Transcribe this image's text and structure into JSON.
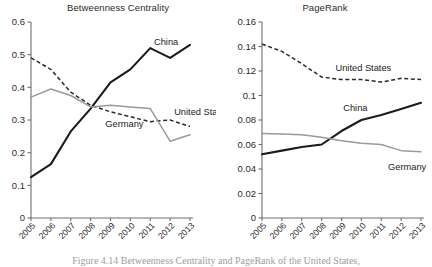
{
  "figure": {
    "caption": "Figure 4.14 Betweenness Centrality and PageRank of the United States,"
  },
  "chart_data": [
    {
      "type": "line",
      "title": "Betweenness Centrality",
      "xlabel": "",
      "ylabel": "",
      "x": [
        "2005",
        "2006",
        "2007",
        "2008",
        "2009",
        "2010",
        "2011",
        "2012",
        "2013"
      ],
      "ylim": [
        0,
        0.6
      ],
      "yticks": [
        "0",
        "0.1",
        "0.2",
        "0.3",
        "0.4",
        "0.5",
        "0.6"
      ],
      "ytick_values": [
        0,
        0.1,
        0.2,
        0.3,
        0.4,
        0.5,
        0.6
      ],
      "grid": false,
      "legend_position": "inline-annotations",
      "series": [
        {
          "name": "China",
          "style": "solid-thick-black",
          "color": "#1b1b1b",
          "label_x": "2012",
          "values": [
            0.125,
            0.165,
            0.265,
            0.335,
            0.415,
            0.455,
            0.52,
            0.49,
            0.53
          ]
        },
        {
          "name": "United States",
          "style": "dashed-black",
          "color": "#2a2a2a",
          "label_x": "2012",
          "values": [
            0.49,
            0.455,
            0.385,
            0.345,
            0.325,
            0.31,
            0.295,
            0.3,
            0.28
          ]
        },
        {
          "name": "Germany",
          "style": "solid-gray",
          "color": "#9a9a9a",
          "label_x": "2010",
          "values": [
            0.37,
            0.395,
            0.375,
            0.34,
            0.345,
            0.34,
            0.335,
            0.235,
            0.255
          ]
        }
      ]
    },
    {
      "type": "line",
      "title": "PageRank",
      "xlabel": "",
      "ylabel": "",
      "x": [
        "2005",
        "2006",
        "2007",
        "2008",
        "2009",
        "2010",
        "2011",
        "2012",
        "2013"
      ],
      "ylim": [
        0,
        0.16
      ],
      "yticks": [
        "0",
        "0.02",
        "0.04",
        "0.06",
        "0.08",
        "0.1",
        "0.12",
        "0.14",
        "0.16"
      ],
      "ytick_values": [
        0,
        0.02,
        0.04,
        0.06,
        0.08,
        0.1,
        0.12,
        0.14,
        0.16
      ],
      "grid": false,
      "legend_position": "inline-annotations",
      "series": [
        {
          "name": "United States",
          "style": "dashed-black",
          "color": "#2a2a2a",
          "label_x": "2010",
          "values": [
            0.142,
            0.136,
            0.126,
            0.115,
            0.113,
            0.113,
            0.111,
            0.114,
            0.113
          ]
        },
        {
          "name": "China",
          "style": "solid-thick-black",
          "color": "#1b1b1b",
          "label_x": "2010",
          "values": [
            0.052,
            0.055,
            0.058,
            0.06,
            0.071,
            0.08,
            0.084,
            0.089,
            0.094
          ]
        },
        {
          "name": "Germany",
          "style": "solid-gray",
          "color": "#9a9a9a",
          "label_x": "2012",
          "values": [
            0.069,
            0.0685,
            0.068,
            0.066,
            0.063,
            0.061,
            0.06,
            0.055,
            0.054
          ]
        }
      ]
    }
  ]
}
